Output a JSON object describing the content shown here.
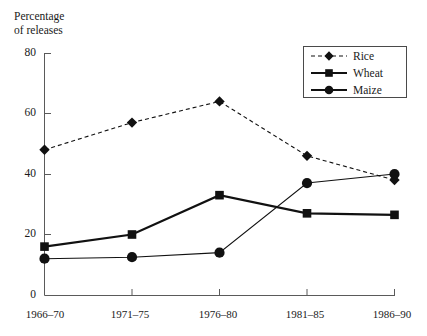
{
  "chart_data": {
    "type": "line",
    "title": "",
    "xlabel": "",
    "ylabel": "Percentage\nof releases",
    "ylim": [
      0,
      80
    ],
    "yticks": [
      0,
      20,
      40,
      60,
      80
    ],
    "ytick_labels": [
      "0",
      "20",
      "40",
      "60",
      "80"
    ],
    "categories": [
      "1966–70",
      "1971–75",
      "1976–80",
      "1981–85",
      "1986–90"
    ],
    "grid": false,
    "legend_position": "upper right",
    "series": [
      {
        "name": "Rice",
        "values": [
          48,
          57,
          64,
          46,
          38
        ],
        "line_style": "dashed",
        "marker": "diamond",
        "color": "#111111"
      },
      {
        "name": "Wheat",
        "values": [
          16,
          20,
          33,
          27,
          26.5
        ],
        "line_style": "solid",
        "marker": "square",
        "color": "#111111"
      },
      {
        "name": "Maize",
        "values": [
          12,
          12.5,
          14,
          37,
          40
        ],
        "line_style": "solid",
        "marker": "circle",
        "color": "#111111"
      }
    ]
  },
  "legend": {
    "entries": [
      {
        "label": "Rice"
      },
      {
        "label": "Wheat"
      },
      {
        "label": "Maize"
      }
    ]
  }
}
